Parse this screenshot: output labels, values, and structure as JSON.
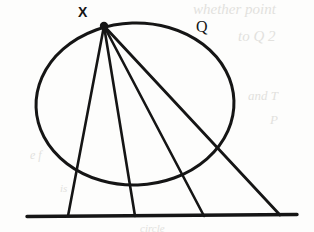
{
  "figure": {
    "kind": "geometry-diagram",
    "background_color": "#fdfdfc",
    "ink_color": "#151515",
    "labels": {
      "vertex": "X",
      "circle": "Q"
    },
    "vertex_point": {
      "x": 104,
      "y": 26,
      "radius": 4
    },
    "circle": {
      "center_x": 135,
      "center_y": 104,
      "radius_x": 99,
      "radius_y": 81,
      "stroke_width": 3
    },
    "base_line": {
      "x1": 27,
      "y1": 216,
      "x2": 297,
      "y2": 215,
      "stroke_width": 3.4
    },
    "rays": [
      {
        "name": "ray-1",
        "x1": 104,
        "y1": 26,
        "x2": 68,
        "y2": 216,
        "stroke_width": 2.6
      },
      {
        "name": "ray-2",
        "x1": 104,
        "y1": 26,
        "x2": 135,
        "y2": 216,
        "stroke_width": 2.6
      },
      {
        "name": "ray-3",
        "x1": 104,
        "y1": 26,
        "x2": 204,
        "y2": 216,
        "stroke_width": 2.6
      },
      {
        "name": "ray-4",
        "x1": 104,
        "y1": 26,
        "x2": 280,
        "y2": 215,
        "stroke_width": 2.8
      }
    ],
    "ghost_marks": [
      {
        "text": "whether point",
        "x": 193,
        "y": 1,
        "size": 15
      },
      {
        "text": "to Q 2",
        "x": 238,
        "y": 28,
        "size": 15
      },
      {
        "text": "and T",
        "x": 248,
        "y": 88,
        "size": 13
      },
      {
        "text": "P",
        "x": 270,
        "y": 112,
        "size": 13
      },
      {
        "text": "e f",
        "x": 30,
        "y": 148,
        "size": 12
      },
      {
        "text": "is",
        "x": 60,
        "y": 182,
        "size": 11
      },
      {
        "text": "circle",
        "x": 140,
        "y": 222,
        "size": 11
      }
    ]
  }
}
